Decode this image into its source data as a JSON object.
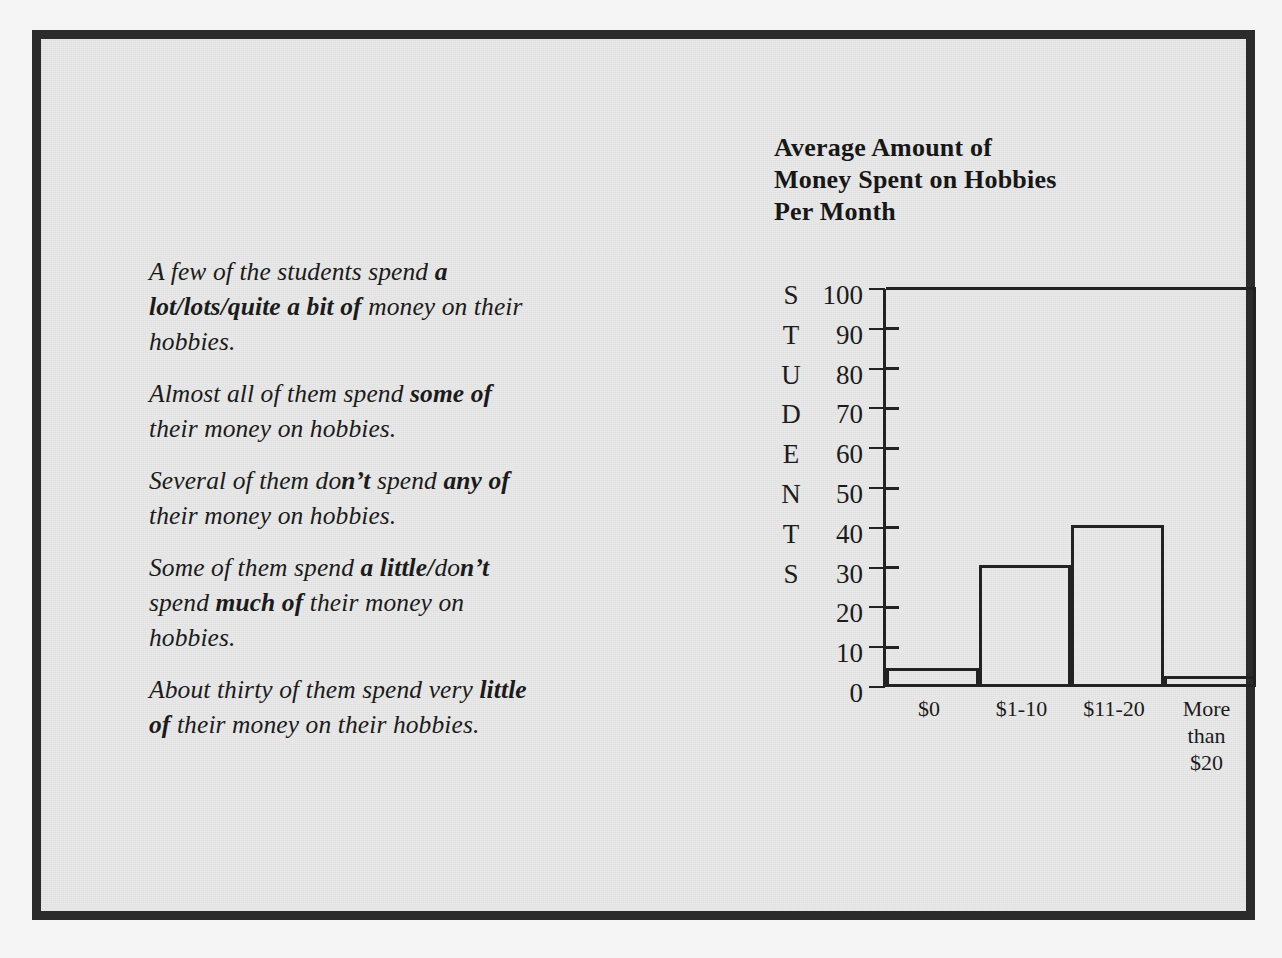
{
  "page": {
    "background_color": "#e9e9e9",
    "border_color": "#2b2b2b"
  },
  "prose": {
    "paragraphs": [
      {
        "id": "p1",
        "text": "A few of the students spend a lot/lots/quite a bit of money on their hobbies.",
        "segments": [
          {
            "text": "A few of the students spend ",
            "bold": false
          },
          {
            "text": "a lot/lots/quite a bit of",
            "bold": true
          },
          {
            "text": " money on their hobbies.",
            "bold": false
          }
        ]
      },
      {
        "id": "p2",
        "text": "Almost all of them spend some of their money on hobbies.",
        "segments": [
          {
            "text": "Almost all of them spend ",
            "bold": false
          },
          {
            "text": "some of",
            "bold": true
          },
          {
            "text": " their money on hobbies.",
            "bold": false
          }
        ]
      },
      {
        "id": "p3",
        "text": "Several of them don't spend any of their money on hobbies.",
        "segments": [
          {
            "text": "Several of them do",
            "bold": false
          },
          {
            "text": "n’t",
            "bold": true
          },
          {
            "text": " spend ",
            "bold": false
          },
          {
            "text": "any of",
            "bold": true
          },
          {
            "text": " their money on hobbies.",
            "bold": false
          }
        ]
      },
      {
        "id": "p4",
        "text": "Some of them spend a little/don't spend much of their money on hobbies.",
        "segments": [
          {
            "text": "Some of them spend ",
            "bold": false
          },
          {
            "text": "a little/",
            "bold": true
          },
          {
            "text": "do",
            "bold": false
          },
          {
            "text": "n’t",
            "bold": true
          },
          {
            "text": " spend ",
            "bold": false
          },
          {
            "text": "much of",
            "bold": true
          },
          {
            "text": " their money on hobbies.",
            "bold": false
          }
        ]
      },
      {
        "id": "p5",
        "text": "About thirty of them spend very little of their money on their hobbies.",
        "segments": [
          {
            "text": "About thirty of them spend very ",
            "bold": false
          },
          {
            "text": "little of",
            "bold": true
          },
          {
            "text": " their money on their hobbies.",
            "bold": false
          }
        ]
      }
    ]
  },
  "chart": {
    "title_lines": [
      "Average Amount of",
      "Money Spent on Hobbies",
      "Per Month"
    ],
    "yaxis_word_letters": [
      "S",
      "T",
      "U",
      "D",
      "E",
      "N",
      "T",
      "S"
    ]
  },
  "chart_data": {
    "type": "bar",
    "categories": [
      "$0",
      "$1-10",
      "$11-20",
      "More than $20"
    ],
    "category_label_lines": [
      [
        "$0"
      ],
      [
        "$1-10"
      ],
      [
        "$11-20"
      ],
      [
        "More",
        "than",
        "$20"
      ]
    ],
    "values": [
      4,
      30,
      40,
      2
    ],
    "xlabel": "",
    "ylabel": "STUDENTS",
    "ylim": [
      0,
      100
    ],
    "yticks": [
      0,
      10,
      20,
      30,
      40,
      50,
      60,
      70,
      80,
      90,
      100
    ],
    "ytick_labels": [
      "100",
      "90",
      "80",
      "70",
      "60",
      "50",
      "40",
      "30",
      "20",
      "10",
      "0"
    ],
    "grid": false,
    "legend": false,
    "bar_fill": "none",
    "bar_stroke": "#222222"
  }
}
